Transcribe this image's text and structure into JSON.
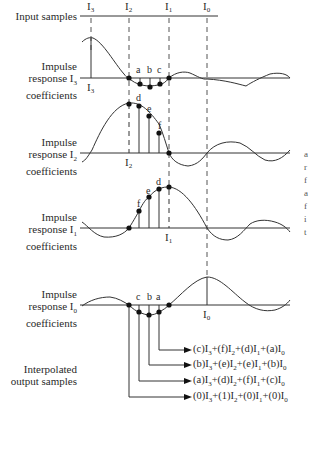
{
  "labels": {
    "input_samples": "Input samples",
    "ir3": [
      "Impulse",
      "response I3",
      "coefficients"
    ],
    "ir2": [
      "Impulse",
      "response I2",
      "coefficients"
    ],
    "ir1": [
      "Impulse",
      "response I1",
      "coefficients"
    ],
    "ir0": [
      "Impulse",
      "response I0",
      "coefficients"
    ],
    "output": [
      "Interpolated",
      "output samples"
    ]
  },
  "sample_symbols": {
    "top": [
      "I3",
      "I2",
      "I1",
      "I0"
    ],
    "i3_axis": "I3",
    "i2_axis": "I2",
    "i1_axis": "I1",
    "i0_axis": "I0"
  },
  "coefficient_letters": {
    "ir3": [
      "a",
      "b",
      "c"
    ],
    "ir2": [
      "d",
      "e",
      "f"
    ],
    "ir1": [
      "f",
      "e",
      "d"
    ],
    "ir0": [
      "c",
      "b",
      "a"
    ]
  },
  "equations": [
    "(c)I3+(f)I2+(d)I1+(a)I0",
    "(b)I3+(e)I2+(e)I1+(b)I0",
    "(a)I3+(d)I2+(f)I1+(c)I0",
    "(0)I3+(1)I2+(0)I1+(0)I0"
  ],
  "clipped_right_text": [
    "a",
    "r",
    "f",
    "a",
    "f",
    "i",
    "t"
  ],
  "colors": {
    "line": "#333333",
    "dash": "#555555",
    "background": "#ffffff"
  }
}
